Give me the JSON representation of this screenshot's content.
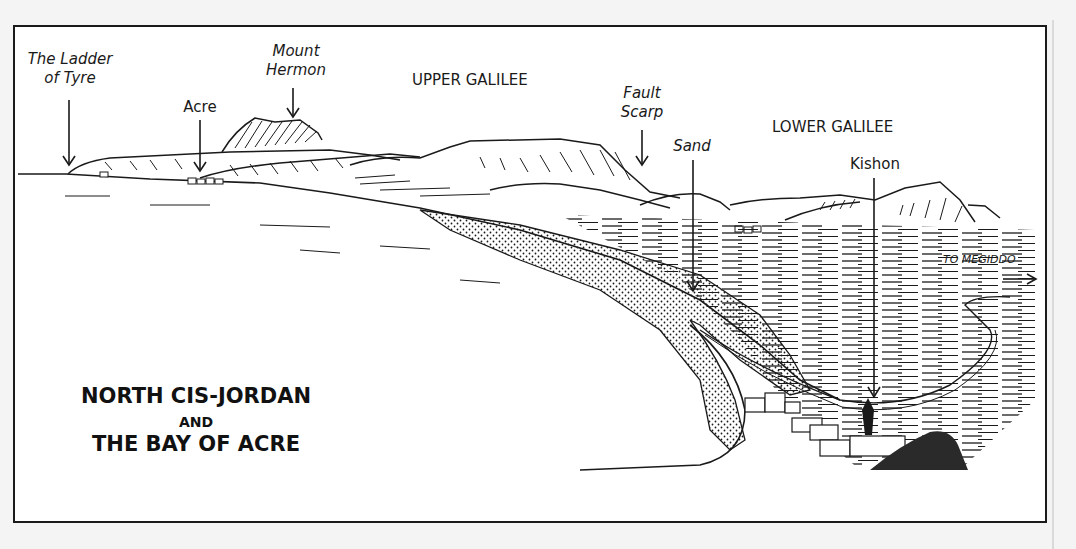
{
  "title": {
    "line1": "NORTH CIS-JORDAN",
    "line2": "AND",
    "line3": "THE BAY OF ACRE"
  },
  "labels": {
    "ladder_of_tyre_1": "The Ladder",
    "ladder_of_tyre_2": "of Tyre",
    "acre": "Acre",
    "mount_hermon_1": "Mount",
    "mount_hermon_2": "Hermon",
    "upper_galilee": "UPPER GALILEE",
    "fault_scarp_1": "Fault",
    "fault_scarp_2": "Scarp",
    "sand": "Sand",
    "lower_galilee": "LOWER GALILEE",
    "kishon": "Kishon",
    "to_megiddo": "TO MEGIDDO"
  },
  "colors": {
    "ink": "#1a1a1a",
    "paper": "#ffffff",
    "background": "#f4f4f4"
  }
}
